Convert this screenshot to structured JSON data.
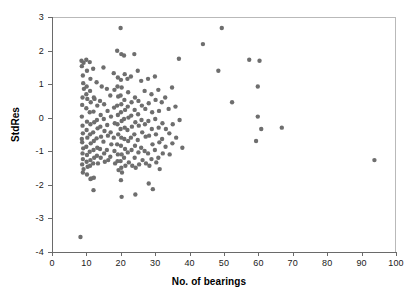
{
  "chart_data": {
    "type": "scatter",
    "title": "",
    "xlabel": "No. of bearings",
    "ylabel": "StdRes",
    "xlim": [
      0,
      100
    ],
    "ylim": [
      -4,
      3
    ],
    "grid": false,
    "legend": "none",
    "xticks": [
      0,
      10,
      20,
      30,
      40,
      50,
      60,
      70,
      80,
      90,
      100
    ],
    "xticklabels": [
      "0",
      "10",
      "20",
      "30",
      "40",
      "50",
      "60",
      "70",
      "80",
      "90",
      "100"
    ],
    "yticks": [
      -4,
      -3,
      -2,
      -1,
      0,
      1,
      2,
      3
    ],
    "yticklabels": [
      "-4",
      "-3",
      "-2",
      "-1",
      "0",
      "1",
      "2",
      "3"
    ],
    "marker": {
      "shape": "circle",
      "color": "#6e6e6e",
      "size_px": 4.4
    },
    "n_points": 196,
    "points": [
      [
        8.3,
        -3.55
      ],
      [
        8.6,
        1.72
      ],
      [
        8.7,
        1.56
      ],
      [
        9.2,
        1.66
      ],
      [
        9.0,
        1.28
      ],
      [
        9.1,
        1.05
      ],
      [
        8.9,
        0.62
      ],
      [
        8.8,
        0.4
      ],
      [
        8.7,
        0.05
      ],
      [
        8.9,
        -0.22
      ],
      [
        9.0,
        -0.45
      ],
      [
        8.8,
        -0.72
      ],
      [
        9.1,
        -0.9
      ],
      [
        8.9,
        -1.05
      ],
      [
        9.0,
        -1.22
      ],
      [
        8.8,
        -1.38
      ],
      [
        9.2,
        -1.52
      ],
      [
        9.0,
        -1.62
      ],
      [
        8.7,
        -0.62
      ],
      [
        9.3,
        0.88
      ],
      [
        10.0,
        1.75
      ],
      [
        10.2,
        1.42
      ],
      [
        10.1,
        0.95
      ],
      [
        10.3,
        0.58
      ],
      [
        10.0,
        0.3
      ],
      [
        10.2,
        -0.1
      ],
      [
        10.1,
        -0.35
      ],
      [
        10.3,
        -0.58
      ],
      [
        10.0,
        -0.85
      ],
      [
        10.2,
        -1.1
      ],
      [
        10.1,
        -1.3
      ],
      [
        10.4,
        -1.45
      ],
      [
        10.2,
        -1.68
      ],
      [
        10.0,
        0.72
      ],
      [
        11.0,
        1.68
      ],
      [
        11.2,
        1.18
      ],
      [
        11.1,
        0.82
      ],
      [
        11.3,
        0.48
      ],
      [
        11.0,
        0.18
      ],
      [
        11.2,
        -0.18
      ],
      [
        11.1,
        -0.48
      ],
      [
        11.3,
        -0.75
      ],
      [
        11.0,
        -1.0
      ],
      [
        11.2,
        -1.25
      ],
      [
        11.1,
        -1.42
      ],
      [
        11.4,
        -1.8
      ],
      [
        11.2,
        -1.82
      ],
      [
        12.0,
        1.48
      ],
      [
        12.2,
        0.62
      ],
      [
        12.1,
        0.2
      ],
      [
        12.3,
        -0.12
      ],
      [
        12.0,
        -0.42
      ],
      [
        12.2,
        -0.68
      ],
      [
        12.1,
        -0.95
      ],
      [
        12.3,
        -1.18
      ],
      [
        12.0,
        -1.35
      ],
      [
        12.2,
        -1.78
      ],
      [
        12.1,
        -2.15
      ],
      [
        12.4,
        0.58
      ],
      [
        13.0,
        1.08
      ],
      [
        13.2,
        0.38
      ],
      [
        13.1,
        -0.05
      ],
      [
        13.3,
        -0.3
      ],
      [
        13.0,
        -0.6
      ],
      [
        13.2,
        -0.88
      ],
      [
        13.1,
        -1.12
      ],
      [
        13.4,
        -1.35
      ],
      [
        14.0,
        0.52
      ],
      [
        14.2,
        0.1
      ],
      [
        14.1,
        -0.25
      ],
      [
        14.3,
        -0.55
      ],
      [
        14.0,
        -0.92
      ],
      [
        14.2,
        -1.18
      ],
      [
        14.5,
        0.95
      ],
      [
        15.0,
        1.52
      ],
      [
        15.2,
        0.42
      ],
      [
        15.1,
        -0.02
      ],
      [
        15.3,
        -0.38
      ],
      [
        15.0,
        -0.7
      ],
      [
        15.2,
        -1.05
      ],
      [
        15.4,
        -1.3
      ],
      [
        16.0,
        0.88
      ],
      [
        16.2,
        0.22
      ],
      [
        16.1,
        -0.2
      ],
      [
        16.3,
        -0.52
      ],
      [
        16.0,
        -0.95
      ],
      [
        16.4,
        -1.25
      ],
      [
        17.0,
        0.68
      ],
      [
        17.2,
        0.05
      ],
      [
        17.1,
        -0.42
      ],
      [
        17.3,
        -0.78
      ],
      [
        17.0,
        -1.15
      ],
      [
        18.0,
        1.35
      ],
      [
        18.2,
        0.85
      ],
      [
        18.1,
        0.32
      ],
      [
        18.3,
        -0.15
      ],
      [
        18.0,
        -0.58
      ],
      [
        18.2,
        -0.98
      ],
      [
        18.4,
        -1.35
      ],
      [
        19.0,
        2.02
      ],
      [
        19.2,
        1.22
      ],
      [
        19.1,
        0.95
      ],
      [
        19.3,
        0.65
      ],
      [
        19.0,
        0.38
      ],
      [
        19.2,
        0.1
      ],
      [
        19.1,
        -0.18
      ],
      [
        19.3,
        -0.48
      ],
      [
        19.0,
        -0.78
      ],
      [
        19.2,
        -1.08
      ],
      [
        19.1,
        -1.28
      ],
      [
        19.4,
        -1.55
      ],
      [
        20.0,
        2.7
      ],
      [
        20.2,
        1.92
      ],
      [
        20.1,
        1.15
      ],
      [
        20.3,
        0.92
      ],
      [
        20.0,
        0.68
      ],
      [
        20.2,
        0.42
      ],
      [
        20.1,
        0.18
      ],
      [
        20.3,
        -0.08
      ],
      [
        20.0,
        -0.32
      ],
      [
        20.2,
        -0.58
      ],
      [
        20.1,
        -0.82
      ],
      [
        20.3,
        -1.08
      ],
      [
        20.0,
        -1.28
      ],
      [
        20.2,
        -1.48
      ],
      [
        20.4,
        -1.62
      ],
      [
        20.1,
        -1.85
      ],
      [
        20.3,
        -2.35
      ],
      [
        21.0,
        1.88
      ],
      [
        21.2,
        1.32
      ],
      [
        21.1,
        0.55
      ],
      [
        21.3,
        0.25
      ],
      [
        21.0,
        -0.02
      ],
      [
        21.2,
        -0.28
      ],
      [
        21.1,
        -0.62
      ],
      [
        21.3,
        -0.92
      ],
      [
        21.0,
        -1.18
      ],
      [
        21.4,
        -1.42
      ],
      [
        22.0,
        1.18
      ],
      [
        22.2,
        0.78
      ],
      [
        22.1,
        0.35
      ],
      [
        22.3,
        0.02
      ],
      [
        22.0,
        -0.35
      ],
      [
        22.2,
        -0.68
      ],
      [
        22.1,
        -1.02
      ],
      [
        22.4,
        -1.32
      ],
      [
        23.0,
        1.25
      ],
      [
        23.2,
        0.48
      ],
      [
        23.1,
        0.08
      ],
      [
        23.3,
        -0.25
      ],
      [
        23.0,
        -0.58
      ],
      [
        23.2,
        -0.95
      ],
      [
        23.4,
        -1.42
      ],
      [
        24.0,
        1.92
      ],
      [
        24.2,
        0.62
      ],
      [
        24.1,
        0.25
      ],
      [
        24.3,
        -0.12
      ],
      [
        24.0,
        -0.48
      ],
      [
        24.2,
        -0.82
      ],
      [
        24.1,
        -1.18
      ],
      [
        24.4,
        -1.48
      ],
      [
        24.3,
        -2.28
      ],
      [
        25.0,
        1.42
      ],
      [
        25.2,
        0.52
      ],
      [
        25.1,
        0.12
      ],
      [
        25.3,
        -0.22
      ],
      [
        25.0,
        -0.65
      ],
      [
        25.2,
        -1.02
      ],
      [
        25.4,
        -1.38
      ],
      [
        26.0,
        1.12
      ],
      [
        26.2,
        0.38
      ],
      [
        26.1,
        -0.05
      ],
      [
        26.3,
        -0.42
      ],
      [
        26.0,
        -0.88
      ],
      [
        26.4,
        -1.25
      ],
      [
        27.0,
        0.82
      ],
      [
        27.2,
        0.28
      ],
      [
        27.1,
        -0.18
      ],
      [
        27.3,
        -0.55
      ],
      [
        27.0,
        -0.98
      ],
      [
        27.4,
        -1.35
      ],
      [
        28.0,
        1.18
      ],
      [
        28.2,
        0.45
      ],
      [
        28.1,
        -0.08
      ],
      [
        28.3,
        -0.52
      ],
      [
        28.0,
        -1.05
      ],
      [
        28.4,
        -1.42
      ],
      [
        28.2,
        -1.95
      ],
      [
        29.0,
        0.72
      ],
      [
        29.2,
        0.18
      ],
      [
        29.1,
        -0.32
      ],
      [
        29.3,
        -0.78
      ],
      [
        29.0,
        -1.22
      ],
      [
        29.4,
        -2.12
      ],
      [
        30.0,
        1.25
      ],
      [
        30.2,
        0.55
      ],
      [
        30.1,
        -0.02
      ],
      [
        30.3,
        -0.48
      ],
      [
        30.0,
        -0.95
      ],
      [
        30.4,
        -1.32
      ],
      [
        31.0,
        0.85
      ],
      [
        31.2,
        0.22
      ],
      [
        31.1,
        -0.28
      ],
      [
        31.3,
        -0.72
      ],
      [
        31.0,
        -1.18
      ],
      [
        31.4,
        -1.52
      ],
      [
        32.0,
        0.48
      ],
      [
        32.2,
        -0.15
      ],
      [
        32.1,
        -0.62
      ],
      [
        32.3,
        -1.05
      ],
      [
        33.0,
        0.62
      ],
      [
        33.2,
        -0.32
      ],
      [
        33.1,
        -0.85
      ],
      [
        34.0,
        0.28
      ],
      [
        34.2,
        -0.45
      ],
      [
        34.3,
        -1.08
      ],
      [
        35.0,
        0.92
      ],
      [
        35.2,
        -0.18
      ],
      [
        35.1,
        -0.75
      ],
      [
        36.0,
        0.35
      ],
      [
        36.2,
        -0.58
      ],
      [
        37.0,
        1.78
      ],
      [
        37.2,
        -0.05
      ],
      [
        38.0,
        -0.88
      ],
      [
        44.0,
        2.22
      ],
      [
        48.5,
        1.42
      ],
      [
        49.5,
        2.7
      ],
      [
        52.5,
        0.48
      ],
      [
        57.5,
        1.75
      ],
      [
        59.5,
        -0.68
      ],
      [
        60.0,
        0.95
      ],
      [
        60.0,
        0.05
      ],
      [
        60.5,
        1.72
      ],
      [
        61.0,
        -0.32
      ],
      [
        67.0,
        -0.28
      ],
      [
        94.0,
        -1.25
      ]
    ]
  }
}
